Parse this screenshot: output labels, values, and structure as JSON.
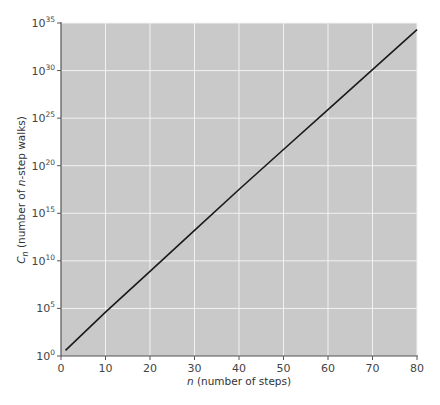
{
  "chart_data": {
    "type": "line",
    "title": "",
    "xlabel": "n (number of steps)",
    "xlabel_parts": {
      "italic": "n",
      "rest": " (number of steps)"
    },
    "ylabel": "C_n (number of n-step walks)",
    "ylabel_parts": {
      "c": "C",
      "sub": "n",
      "mid": " (number of ",
      "italic": "n",
      "rest": "-step walks)"
    },
    "xlim": [
      0,
      80
    ],
    "ylim_log10": [
      0,
      35
    ],
    "yscale": "log",
    "grid": true,
    "legend": null,
    "x_ticks": [
      0,
      10,
      20,
      30,
      40,
      50,
      60,
      70,
      80
    ],
    "y_ticks": [
      {
        "base": "10",
        "exp": "0"
      },
      {
        "base": "10",
        "exp": "5"
      },
      {
        "base": "10",
        "exp": "10"
      },
      {
        "base": "10",
        "exp": "15"
      },
      {
        "base": "10",
        "exp": "20"
      },
      {
        "base": "10",
        "exp": "25"
      },
      {
        "base": "10",
        "exp": "30"
      },
      {
        "base": "10",
        "exp": "35"
      }
    ],
    "series": [
      {
        "name": "C_n",
        "x": [
          1,
          10,
          20,
          30,
          40,
          50,
          60,
          70,
          80
        ],
        "log10_y": [
          0.6,
          4.6,
          8.9,
          13.2,
          17.5,
          21.7,
          25.9,
          30.1,
          34.3
        ]
      }
    ],
    "colors": {
      "plot_background": "#c9c9c9",
      "grid": "#f2f2f2",
      "line": "#1a1a1a",
      "axis": "#555555"
    }
  }
}
